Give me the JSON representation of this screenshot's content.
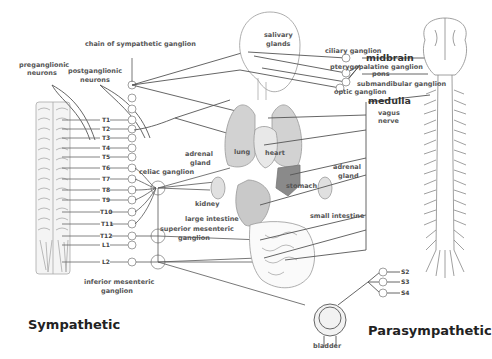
{
  "diagram": {
    "titles": {
      "sympathetic": "Sympathetic",
      "parasympathetic": "Parasympathetic"
    },
    "sympathetic_labels": {
      "chain": "chain of sympathetic ganglion",
      "preganglionic_1": "preganglionic",
      "preganglionic_2": "neurons",
      "postganglionic_1": "postganglionic",
      "postganglionic_2": "neurons",
      "celiac": "celiac ganglion",
      "superior_mesenteric_1": "superior mesenteric",
      "superior_mesenteric_2": "ganglion",
      "inferior_mesenteric_1": "inferior mesenteric",
      "inferior_mesenteric_2": "ganglion"
    },
    "spinal_segments": [
      "T1",
      "T2",
      "T3",
      "T4",
      "T5",
      "T6",
      "T7",
      "T8",
      "T9",
      "T10",
      "T11",
      "T12",
      "L1",
      "L2"
    ],
    "sacral_segments": [
      "S2",
      "S3",
      "S4"
    ],
    "organs": {
      "salivary_1": "salivary",
      "salivary_2": "glands",
      "lung": "lung",
      "heart": "heart",
      "adrenal_left_1": "adrenal",
      "adrenal_left_2": "gland",
      "adrenal_right_1": "adrenal",
      "adrenal_right_2": "gland",
      "stomach": "stomach",
      "kidney": "kidney",
      "large_intestine": "large intestine",
      "small_intestine": "small intestine",
      "bladder": "bladder"
    },
    "parasympathetic_labels": {
      "ciliary": "ciliary ganglion",
      "midbrain": "midbrain",
      "pterygopalatine": "pterygopalatine ganglion",
      "pons": "pons",
      "submandibular": "submandibular ganglion",
      "otic": "optic ganglion",
      "medulla": "medulla",
      "vagus_1": "vagus",
      "vagus_2": "nerve"
    },
    "colors": {
      "line": "#555555",
      "organ_fill": "#cfcfcf",
      "organ_dark": "#8a8a8a",
      "outline": "#8c8c8c"
    }
  }
}
